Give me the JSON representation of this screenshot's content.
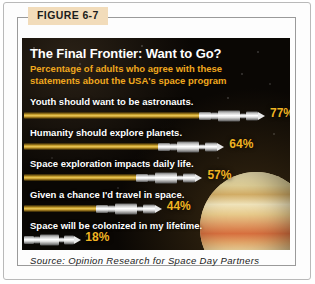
{
  "figure": {
    "tag": "FIGURE 6-7",
    "headline": "The Final Frontier: Want to Go?",
    "subhead": "Percentage of adults who agree with these statements about the USA's space program",
    "source": "Source: Opinion Research for Space Day Partners",
    "colors": {
      "panel_background": "#0a0704",
      "headline_text": "#ffffff",
      "subhead_text": "#f0a81e",
      "value_text": "#f0b322",
      "trail_gold": "#e8c659",
      "rocket_silver": "#e9e9e9",
      "tag_background": "#f2dcba",
      "frame_border": "#9a9a9a"
    }
  },
  "chart_data": {
    "type": "bar",
    "title": "The Final Frontier: Want to Go?",
    "subtitle": "Percentage of adults who agree with these statements about the USA's space program",
    "xlabel": "",
    "ylabel": "",
    "xlim": [
      0,
      100
    ],
    "grid": false,
    "legend": "none",
    "orientation": "horizontal",
    "units": "percent",
    "categories": [
      "Youth should want to be astronauts.",
      "Humanity should explore planets.",
      "Space exploration impacts daily life.",
      "Given a chance I'd travel in space.",
      "Space will be colonized in my lifetime."
    ],
    "values": [
      77,
      64,
      57,
      44,
      18
    ],
    "value_labels": [
      "77%",
      "64%",
      "57%",
      "44%",
      "18%"
    ],
    "annotations": [
      "Jupiter-like planet illustration, lower right"
    ],
    "source": "Opinion Research for Space Day Partners"
  },
  "rows": [
    {
      "label": "Youth should want to be astronauts.",
      "value": 77,
      "pct": "77%"
    },
    {
      "label": "Humanity should explore planets.",
      "value": 64,
      "pct": "64%"
    },
    {
      "label": "Space exploration impacts daily life.",
      "value": 57,
      "pct": "57%"
    },
    {
      "label": "Given a chance I'd travel in space.",
      "value": 44,
      "pct": "44%"
    },
    {
      "label": "Space will be colonized in my lifetime.",
      "value": 18,
      "pct": "18%"
    }
  ]
}
